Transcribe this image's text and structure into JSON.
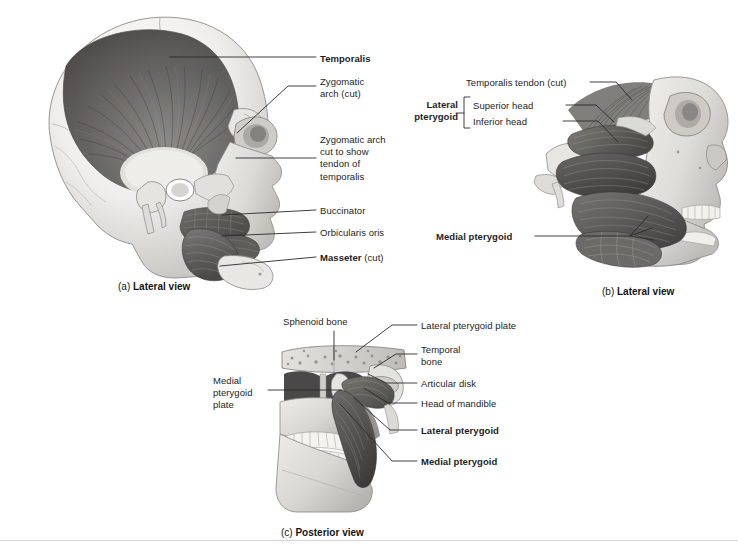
{
  "figure": {
    "background": "#ffffff",
    "rule_color": "#d2d4d7",
    "text_color": "#1d1d1d"
  },
  "panel_a": {
    "caption_tag": "(a)",
    "caption_name": "Lateral view",
    "labels": {
      "temporalis": "Temporalis",
      "zygomatic_arch_cut": "Zygomatic\narch (cut)",
      "zygomatic_arch_tendon": "Zygomatic arch\ncut to show\ntendon of\ntemporalis",
      "buccinator": "Buccinator",
      "orbicularis_oris": "Orbicularis oris",
      "masseter": "Masseter",
      "masseter_suffix": " (cut)"
    }
  },
  "panel_b": {
    "caption_tag": "(b)",
    "caption_name": "Lateral view",
    "labels": {
      "temporalis_tendon_cut": "Temporalis tendon (cut)",
      "lateral_pterygoid": "Lateral\npterygoid",
      "superior_head": "Superior head",
      "inferior_head": "Inferior head",
      "medial_pterygoid": "Medial pterygoid"
    }
  },
  "panel_c": {
    "caption_tag": "(c)",
    "caption_name": "Posterior view",
    "labels": {
      "sphenoid_bone": "Sphenoid bone",
      "medial_pterygoid_plate": "Medial\npterygoid\nplate",
      "lateral_pterygoid_plate": "Lateral pterygoid plate",
      "temporal_bone": "Temporal\nbone",
      "articular_disk": "Articular disk",
      "head_of_mandible": "Head of mandible",
      "lateral_pterygoid": "Lateral pterygoid",
      "medial_pterygoid": "Medial pterygoid"
    }
  }
}
